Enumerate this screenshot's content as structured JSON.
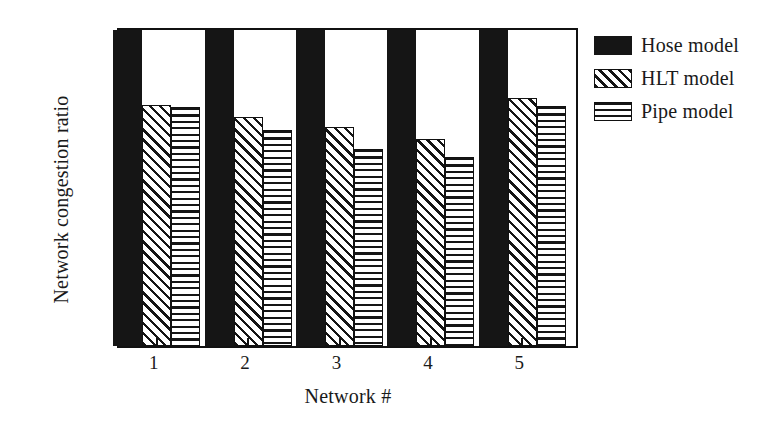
{
  "chart_data": {
    "type": "bar",
    "title": "",
    "subtitle": "",
    "xlabel": "Network #",
    "ylabel": "Network congestion ratio",
    "categories": [
      "1",
      "2",
      "3",
      "4",
      "5"
    ],
    "series": [
      {
        "name": "Hose model",
        "values": [
          1.0,
          1.0,
          1.0,
          1.0,
          1.0
        ],
        "fill": "solid-black",
        "color": "#151515"
      },
      {
        "name": "HLT model",
        "values": [
          0.762,
          0.725,
          0.693,
          0.656,
          0.784
        ],
        "fill": "diagonal-hatch",
        "color": "#151515"
      },
      {
        "name": "Pipe model",
        "values": [
          0.755,
          0.684,
          0.625,
          0.597,
          0.759
        ],
        "fill": "horizontal-hatch",
        "color": "#151515"
      }
    ],
    "ylim": [
      0,
      1
    ],
    "ytick_labels": [
      "0",
      "0.2",
      "0.4",
      "0.6",
      "0.8",
      "1"
    ],
    "ytick_values": [
      0,
      0.2,
      0.4,
      0.6,
      0.8,
      1
    ],
    "yminor_values": [
      0.1,
      0.3,
      0.5,
      0.7,
      0.9
    ],
    "grid": false,
    "legend_position": "right-top",
    "legend": [
      "Hose model",
      "HLT model",
      "Pipe model"
    ],
    "annotations": []
  },
  "legend": {
    "items": [
      {
        "label": "Hose model",
        "swatch": "solid-black-swatch"
      },
      {
        "label": "HLT model",
        "swatch": "diagonal-hatch-swatch"
      },
      {
        "label": "Pipe model",
        "swatch": "horizontal-hatch-swatch"
      }
    ]
  },
  "axes": {
    "y_title": "Network congestion ratio",
    "x_title": "Network #",
    "y_ticks": [
      "1",
      "0.8",
      "0.6",
      "0.4",
      "0.2",
      "0"
    ],
    "x_ticks": [
      "1",
      "2",
      "3",
      "4",
      "5"
    ]
  },
  "colors": {
    "ink": "#151515",
    "background": "#ffffff"
  }
}
